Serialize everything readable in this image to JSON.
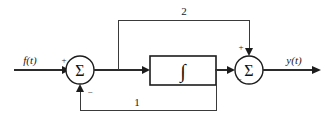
{
  "diagram": {
    "type": "control-system-block-diagram",
    "title": "",
    "background_color": "#ffffff",
    "line_color": "#2b2b2b",
    "signals": {
      "input_label": "f(t)",
      "output_label": "y(t)"
    },
    "blocks": [
      {
        "id": "integrator",
        "label": "∫",
        "shape": "rectangle"
      }
    ],
    "summing_junctions": [
      {
        "id": "left-summer",
        "label": "Σ",
        "signs": {
          "west_input": "+",
          "south_input": "−"
        }
      },
      {
        "id": "right-summer",
        "label": "Σ",
        "signs": {
          "north_input": "+",
          "west_input": "−"
        }
      }
    ],
    "paths": [
      {
        "id": "feedforward-path",
        "gain_label": "2",
        "from": "left-summer-output",
        "to": "right-summer-north"
      },
      {
        "id": "feedback-path",
        "gain_label": "1",
        "from": "integrator-output",
        "to": "left-summer-south"
      }
    ]
  }
}
